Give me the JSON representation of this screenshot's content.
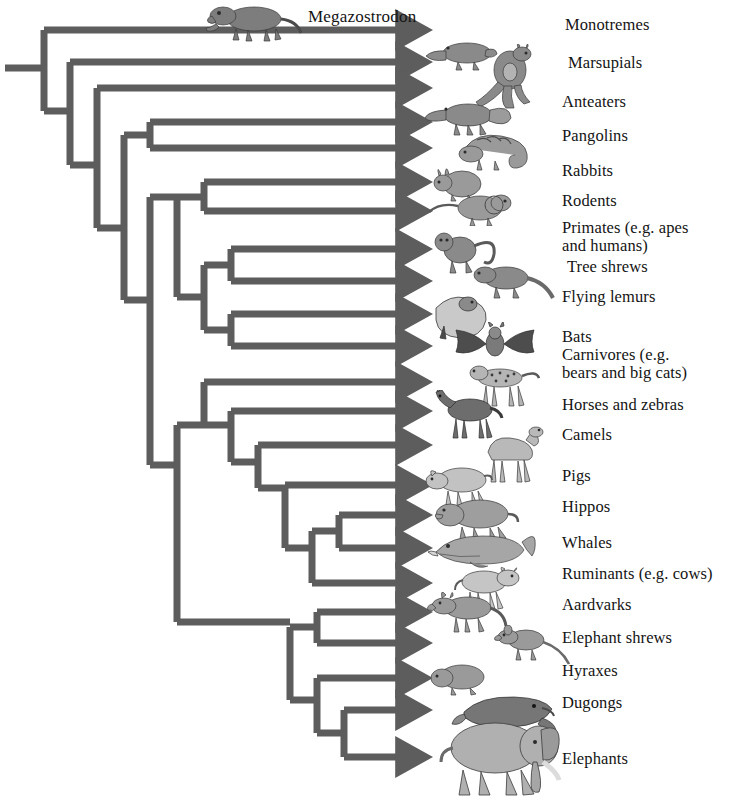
{
  "figure": {
    "type": "cladogram",
    "title": "",
    "line_color": "#5d5d5d",
    "text_color": "#141414",
    "background": "#ffffff",
    "fossil_taxon": {
      "name": "Megazostrodon",
      "label": "Megazostrodon"
    }
  },
  "taxa": [
    {
      "id": "megazostrodon",
      "label": "",
      "icon": "megazostrodon-icon",
      "row": 0,
      "tip_y": 30
    },
    {
      "id": "monotremes",
      "label": "Monotremes",
      "icon": "platypus-icon",
      "row": 1,
      "tip_y": 62
    },
    {
      "id": "marsupials",
      "label": "Marsupials",
      "icon": "kangaroo-icon",
      "row": 2,
      "tip_y": 88
    },
    {
      "id": "anteaters",
      "label": "Anteaters",
      "icon": "anteater-icon",
      "row": 3,
      "tip_y": 122
    },
    {
      "id": "pangolins",
      "label": "Pangolins",
      "icon": "pangolin-icon",
      "row": 4,
      "tip_y": 148
    },
    {
      "id": "rabbits",
      "label": "Rabbits",
      "icon": "rabbit-icon",
      "row": 5,
      "tip_y": 182
    },
    {
      "id": "rodents",
      "label": "Rodents",
      "icon": "rodent-icon",
      "row": 6,
      "tip_y": 211
    },
    {
      "id": "primates",
      "label": "Primates (e.g. apes\nand humans)",
      "icon": "monkey-icon",
      "row": 7,
      "tip_y": 249
    },
    {
      "id": "treeshrews",
      "label": "Tree shrews",
      "icon": "treeshrew-icon",
      "row": 8,
      "tip_y": 281
    },
    {
      "id": "flyinglemurs",
      "label": "Flying lemurs",
      "icon": "flyinglemur-icon",
      "row": 9,
      "tip_y": 314
    },
    {
      "id": "bats",
      "label": "Bats",
      "icon": "bat-icon",
      "row": 10,
      "tip_y": 346
    },
    {
      "id": "carnivores",
      "label": "Carnivores (e.g.\nbears and big cats)",
      "icon": "cheetah-icon",
      "row": 11,
      "tip_y": 382
    },
    {
      "id": "horses",
      "label": "Horses and zebras",
      "icon": "horse-icon",
      "row": 12,
      "tip_y": 411
    },
    {
      "id": "camels",
      "label": "Camels",
      "icon": "camel-icon",
      "row": 13,
      "tip_y": 445
    },
    {
      "id": "pigs",
      "label": "Pigs",
      "icon": "pig-icon",
      "row": 14,
      "tip_y": 485
    },
    {
      "id": "hippos",
      "label": "Hippos",
      "icon": "hippo-icon",
      "row": 15,
      "tip_y": 515
    },
    {
      "id": "whales",
      "label": "Whales",
      "icon": "whale-icon",
      "row": 16,
      "tip_y": 548
    },
    {
      "id": "ruminants",
      "label": "Ruminants (e.g. cows)",
      "icon": "cow-icon",
      "row": 17,
      "tip_y": 583
    },
    {
      "id": "aardvarks",
      "label": "Aardvarks",
      "icon": "aardvark-icon",
      "row": 18,
      "tip_y": 612
    },
    {
      "id": "elephantshrews",
      "label": "Elephant shrews",
      "icon": "elephantshrew-icon",
      "row": 19,
      "tip_y": 643
    },
    {
      "id": "hyraxes",
      "label": "Hyraxes",
      "icon": "hyrax-icon",
      "row": 20,
      "tip_y": 678
    },
    {
      "id": "dugongs",
      "label": "Dugongs",
      "icon": "dugong-icon",
      "row": 21,
      "tip_y": 710
    },
    {
      "id": "elephants",
      "label": "Elephants",
      "icon": "elephant-icon",
      "row": 22,
      "tip_y": 757
    }
  ],
  "labels_x": 565,
  "tip_x": 420,
  "root_stem": {
    "x1": 5,
    "x2": 44,
    "y": 68
  },
  "branches": {
    "note": "Nested cladogram: Megazostrodon basal; then Monotremes; Marsupials; then Placentalia splitting into Xenarthra/Pholidota group, Euarchontoglires, Laurasiatheria and Afrotheria."
  }
}
